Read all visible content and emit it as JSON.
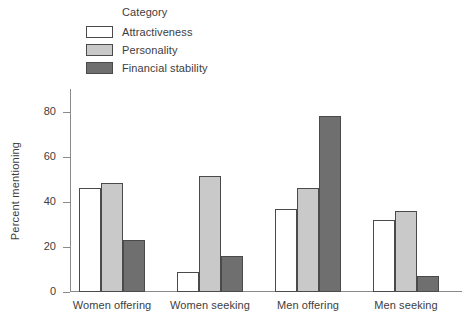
{
  "chart_data": {
    "type": "bar",
    "title": "",
    "xlabel": "",
    "ylabel": "Percent mentioning",
    "ylim": [
      0,
      90
    ],
    "yticks": [
      0,
      20,
      40,
      60,
      80
    ],
    "grid": false,
    "legend_title": "Category",
    "legend_position": "top-left",
    "categories": [
      "Women offering",
      "Women seeking",
      "Men offering",
      "Men seeking"
    ],
    "series": [
      {
        "name": "Attractiveness",
        "color": "#ffffff",
        "edge_color": "#4a4a4a",
        "values": [
          46,
          9,
          37,
          32
        ]
      },
      {
        "name": "Personality",
        "color": "#c9c9c9",
        "edge_color": "#4a4a4a",
        "values": [
          48.5,
          51.5,
          46,
          36
        ]
      },
      {
        "name": "Financial stability",
        "color": "#6f6f6f",
        "edge_color": "#4a4a4a",
        "values": [
          23,
          16,
          78,
          7
        ]
      }
    ]
  },
  "axis": {
    "tick_labels": [
      "0",
      "20",
      "40",
      "60",
      "80"
    ]
  }
}
